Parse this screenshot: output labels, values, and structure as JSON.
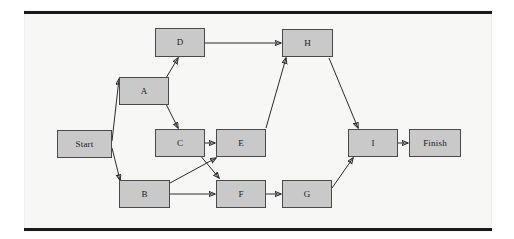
{
  "diagram": {
    "type": "activity-on-node network",
    "canvas": {
      "width": 514,
      "height": 239
    },
    "panel": {
      "x": 24,
      "y": 10,
      "width": 468,
      "height": 222,
      "background": "#f7f7f5"
    },
    "rules": [
      {
        "name": "top-rule",
        "x": 24,
        "y": 11,
        "width": 468,
        "height": 3,
        "color": "#1a1a1a"
      },
      {
        "name": "bottom-rule",
        "x": 24,
        "y": 228,
        "width": 468,
        "height": 3,
        "color": "#1a1a1a"
      }
    ],
    "style": {
      "node_fill": "#c9c9c9",
      "node_border": "#4a4a4a",
      "edge_color": "#2b2b2b",
      "label_color": "#1a1a1a"
    },
    "nodes": [
      {
        "id": "start",
        "label": "Start",
        "x": 57,
        "y": 130,
        "width": 55,
        "height": 28
      },
      {
        "id": "a",
        "label": "A",
        "x": 119,
        "y": 77,
        "width": 50,
        "height": 28
      },
      {
        "id": "b",
        "label": "B",
        "x": 119,
        "y": 180,
        "width": 51,
        "height": 28
      },
      {
        "id": "c",
        "label": "C",
        "x": 155,
        "y": 129,
        "width": 50,
        "height": 28
      },
      {
        "id": "d",
        "label": "D",
        "x": 155,
        "y": 28,
        "width": 50,
        "height": 29
      },
      {
        "id": "e",
        "label": "E",
        "x": 216,
        "y": 129,
        "width": 50,
        "height": 28
      },
      {
        "id": "f",
        "label": "F",
        "x": 216,
        "y": 180,
        "width": 50,
        "height": 28
      },
      {
        "id": "g",
        "label": "G",
        "x": 282,
        "y": 180,
        "width": 50,
        "height": 28
      },
      {
        "id": "h",
        "label": "H",
        "x": 282,
        "y": 29,
        "width": 51,
        "height": 28
      },
      {
        "id": "i",
        "label": "I",
        "x": 348,
        "y": 129,
        "width": 50,
        "height": 28
      },
      {
        "id": "finish",
        "label": "Finish",
        "x": 409,
        "y": 129,
        "width": 52,
        "height": 28
      }
    ],
    "edges": [
      {
        "id": "start-a",
        "from": "Start",
        "to": "A",
        "x1": 112,
        "y1": 141,
        "x2": 119,
        "y2": 79
      },
      {
        "id": "start-b",
        "from": "Start",
        "to": "B",
        "x1": 112,
        "y1": 148,
        "x2": 120,
        "y2": 180
      },
      {
        "id": "a-d",
        "from": "A",
        "to": "D",
        "x1": 166,
        "y1": 78,
        "x2": 178,
        "y2": 58
      },
      {
        "id": "a-c",
        "from": "A",
        "to": "C",
        "x1": 166,
        "y1": 104,
        "x2": 178,
        "y2": 128
      },
      {
        "id": "d-h",
        "from": "D",
        "to": "H",
        "x1": 205,
        "y1": 43,
        "x2": 281,
        "y2": 43
      },
      {
        "id": "c-e",
        "from": "C",
        "to": "E",
        "x1": 205,
        "y1": 143,
        "x2": 215,
        "y2": 143
      },
      {
        "id": "c-f",
        "from": "C",
        "to": "F",
        "x1": 199,
        "y1": 154,
        "x2": 219,
        "y2": 178
      },
      {
        "id": "b-e",
        "from": "B",
        "to": "E",
        "x1": 170,
        "y1": 183,
        "x2": 216,
        "y2": 158
      },
      {
        "id": "b-f",
        "from": "B",
        "to": "F",
        "x1": 170,
        "y1": 194,
        "x2": 215,
        "y2": 194
      },
      {
        "id": "e-h",
        "from": "E",
        "to": "H",
        "x1": 266,
        "y1": 128,
        "x2": 286,
        "y2": 58
      },
      {
        "id": "f-g",
        "from": "F",
        "to": "G",
        "x1": 266,
        "y1": 194,
        "x2": 281,
        "y2": 194
      },
      {
        "id": "g-i",
        "from": "G",
        "to": "I",
        "x1": 332,
        "y1": 188,
        "x2": 353,
        "y2": 158
      },
      {
        "id": "h-i",
        "from": "H",
        "to": "I",
        "x1": 329,
        "y1": 58,
        "x2": 358,
        "y2": 128
      },
      {
        "id": "i-finish",
        "from": "I",
        "to": "Finish",
        "x1": 398,
        "y1": 143,
        "x2": 408,
        "y2": 143
      }
    ]
  }
}
